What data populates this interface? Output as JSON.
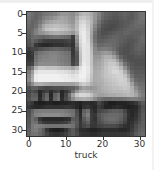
{
  "chart_data": {
    "type": "heatmap",
    "title": "",
    "xlabel": "truck",
    "ylabel": "",
    "colormap": "gray",
    "xlim": [
      -0.5,
      31.5
    ],
    "ylim": [
      31.5,
      -0.5
    ],
    "xticks": [
      0,
      10,
      20,
      30
    ],
    "yticks": [
      0,
      5,
      10,
      15,
      20,
      25,
      30
    ],
    "shape": [
      32,
      32
    ],
    "pixels": [
      [
        120,
        110,
        100,
        105,
        115,
        120,
        125,
        130,
        140,
        150,
        150,
        145,
        140,
        155,
        175,
        185,
        180,
        170,
        150,
        130,
        110,
        100,
        95,
        90,
        90,
        95,
        100,
        95,
        90,
        100,
        110,
        115
      ],
      [
        115,
        105,
        100,
        110,
        125,
        135,
        140,
        150,
        160,
        165,
        160,
        150,
        145,
        170,
        195,
        200,
        190,
        175,
        150,
        125,
        105,
        95,
        90,
        85,
        85,
        90,
        95,
        90,
        90,
        100,
        110,
        115
      ],
      [
        110,
        100,
        105,
        120,
        140,
        155,
        165,
        170,
        175,
        170,
        165,
        155,
        150,
        180,
        210,
        215,
        200,
        180,
        145,
        115,
        95,
        85,
        80,
        80,
        80,
        85,
        90,
        90,
        95,
        105,
        110,
        110
      ],
      [
        105,
        100,
        110,
        135,
        165,
        180,
        185,
        190,
        190,
        185,
        180,
        170,
        160,
        185,
        220,
        225,
        205,
        175,
        135,
        105,
        85,
        80,
        75,
        75,
        80,
        85,
        90,
        95,
        100,
        105,
        105,
        105
      ],
      [
        100,
        105,
        125,
        150,
        175,
        195,
        200,
        205,
        200,
        195,
        190,
        180,
        170,
        190,
        225,
        230,
        210,
        170,
        125,
        95,
        80,
        75,
        75,
        80,
        85,
        90,
        95,
        100,
        100,
        100,
        100,
        100
      ],
      [
        95,
        110,
        130,
        145,
        150,
        160,
        170,
        175,
        175,
        170,
        165,
        160,
        150,
        175,
        225,
        235,
        215,
        165,
        115,
        90,
        80,
        80,
        85,
        90,
        95,
        95,
        100,
        100,
        95,
        95,
        95,
        100
      ],
      [
        90,
        105,
        110,
        105,
        100,
        105,
        110,
        115,
        115,
        110,
        105,
        100,
        60,
        150,
        220,
        235,
        215,
        160,
        110,
        90,
        85,
        90,
        95,
        100,
        100,
        95,
        95,
        90,
        90,
        95,
        100,
        105
      ],
      [
        85,
        100,
        90,
        75,
        65,
        60,
        60,
        60,
        60,
        60,
        65,
        70,
        55,
        140,
        215,
        235,
        220,
        165,
        115,
        95,
        95,
        100,
        105,
        105,
        100,
        95,
        90,
        85,
        85,
        90,
        100,
        105
      ],
      [
        80,
        90,
        55,
        45,
        40,
        40,
        45,
        50,
        50,
        50,
        55,
        60,
        50,
        125,
        210,
        230,
        225,
        175,
        125,
        105,
        105,
        110,
        110,
        105,
        100,
        90,
        85,
        80,
        85,
        95,
        100,
        100
      ],
      [
        60,
        70,
        70,
        80,
        85,
        90,
        95,
        100,
        100,
        95,
        90,
        85,
        55,
        105,
        200,
        230,
        225,
        185,
        135,
        120,
        125,
        125,
        120,
        110,
        95,
        85,
        80,
        80,
        85,
        95,
        100,
        95
      ],
      [
        50,
        60,
        100,
        115,
        120,
        125,
        130,
        130,
        125,
        120,
        115,
        110,
        55,
        90,
        195,
        230,
        225,
        190,
        140,
        140,
        150,
        155,
        150,
        130,
        105,
        85,
        80,
        80,
        85,
        90,
        95,
        90
      ],
      [
        50,
        55,
        110,
        125,
        130,
        130,
        135,
        135,
        130,
        125,
        120,
        115,
        60,
        85,
        190,
        230,
        225,
        195,
        150,
        150,
        165,
        175,
        175,
        160,
        130,
        100,
        85,
        80,
        80,
        85,
        85,
        85
      ],
      [
        55,
        60,
        115,
        130,
        135,
        135,
        135,
        135,
        130,
        125,
        120,
        115,
        65,
        85,
        190,
        230,
        225,
        195,
        155,
        160,
        170,
        185,
        190,
        185,
        160,
        125,
        95,
        85,
        80,
        80,
        80,
        80
      ],
      [
        65,
        70,
        125,
        140,
        140,
        140,
        140,
        140,
        135,
        130,
        125,
        120,
        70,
        90,
        195,
        235,
        225,
        195,
        160,
        165,
        175,
        190,
        200,
        200,
        185,
        155,
        115,
        95,
        85,
        80,
        80,
        80
      ],
      [
        100,
        120,
        180,
        200,
        200,
        195,
        195,
        195,
        190,
        185,
        180,
        175,
        165,
        185,
        225,
        240,
        230,
        200,
        165,
        170,
        180,
        195,
        205,
        210,
        205,
        185,
        145,
        110,
        90,
        85,
        85,
        85
      ],
      [
        120,
        155,
        220,
        230,
        230,
        230,
        230,
        230,
        225,
        225,
        220,
        215,
        205,
        215,
        235,
        240,
        230,
        200,
        170,
        175,
        185,
        195,
        205,
        215,
        215,
        205,
        175,
        135,
        100,
        90,
        90,
        90
      ],
      [
        130,
        170,
        235,
        240,
        240,
        240,
        240,
        240,
        240,
        235,
        235,
        230,
        225,
        230,
        240,
        240,
        225,
        195,
        170,
        175,
        185,
        195,
        200,
        205,
        210,
        210,
        195,
        160,
        115,
        95,
        95,
        95
      ],
      [
        135,
        175,
        235,
        240,
        240,
        240,
        240,
        240,
        240,
        240,
        235,
        235,
        230,
        230,
        235,
        235,
        220,
        190,
        170,
        175,
        180,
        190,
        195,
        200,
        205,
        210,
        205,
        180,
        135,
        105,
        100,
        100
      ],
      [
        110,
        140,
        170,
        175,
        170,
        165,
        160,
        160,
        160,
        160,
        160,
        160,
        160,
        170,
        195,
        205,
        195,
        175,
        165,
        170,
        175,
        185,
        190,
        195,
        200,
        205,
        205,
        195,
        160,
        120,
        110,
        110
      ],
      [
        80,
        95,
        95,
        80,
        75,
        70,
        75,
        80,
        80,
        80,
        85,
        90,
        95,
        110,
        145,
        160,
        155,
        150,
        155,
        165,
        175,
        180,
        185,
        190,
        190,
        195,
        200,
        195,
        175,
        140,
        120,
        115
      ],
      [
        70,
        80,
        70,
        40,
        55,
        65,
        45,
        60,
        70,
        40,
        55,
        75,
        110,
        150,
        175,
        180,
        175,
        165,
        160,
        165,
        170,
        175,
        180,
        185,
        185,
        185,
        190,
        190,
        180,
        155,
        130,
        120
      ],
      [
        75,
        95,
        90,
        40,
        75,
        100,
        40,
        95,
        110,
        40,
        70,
        110,
        160,
        200,
        215,
        215,
        210,
        195,
        170,
        160,
        160,
        165,
        170,
        170,
        175,
        175,
        180,
        185,
        180,
        165,
        140,
        125
      ],
      [
        80,
        100,
        100,
        45,
        80,
        105,
        45,
        100,
        115,
        45,
        75,
        100,
        140,
        165,
        170,
        175,
        170,
        160,
        140,
        120,
        110,
        105,
        105,
        110,
        110,
        110,
        115,
        120,
        125,
        125,
        120,
        115
      ],
      [
        65,
        55,
        35,
        30,
        30,
        35,
        35,
        30,
        30,
        35,
        35,
        40,
        45,
        40,
        35,
        45,
        45,
        40,
        45,
        70,
        55,
        40,
        30,
        30,
        35,
        35,
        35,
        40,
        45,
        55,
        75,
        90
      ],
      [
        55,
        45,
        40,
        40,
        45,
        50,
        50,
        50,
        50,
        50,
        55,
        55,
        50,
        40,
        30,
        50,
        55,
        45,
        40,
        60,
        50,
        35,
        35,
        40,
        45,
        40,
        35,
        30,
        35,
        40,
        60,
        80
      ],
      [
        75,
        100,
        120,
        125,
        125,
        125,
        125,
        125,
        125,
        125,
        120,
        115,
        110,
        75,
        40,
        95,
        110,
        55,
        45,
        70,
        75,
        80,
        90,
        95,
        95,
        90,
        70,
        45,
        40,
        45,
        65,
        85
      ],
      [
        80,
        110,
        130,
        135,
        140,
        140,
        140,
        140,
        140,
        135,
        130,
        125,
        115,
        80,
        45,
        105,
        125,
        60,
        55,
        85,
        95,
        100,
        105,
        105,
        105,
        100,
        80,
        50,
        40,
        50,
        70,
        90
      ],
      [
        85,
        110,
        95,
        55,
        40,
        40,
        40,
        40,
        40,
        40,
        45,
        50,
        90,
        85,
        50,
        90,
        110,
        60,
        50,
        80,
        95,
        105,
        110,
        110,
        105,
        95,
        75,
        45,
        45,
        55,
        75,
        90
      ],
      [
        85,
        115,
        110,
        75,
        60,
        55,
        55,
        55,
        55,
        60,
        65,
        80,
        105,
        90,
        55,
        80,
        95,
        60,
        55,
        75,
        85,
        95,
        100,
        100,
        95,
        85,
        65,
        45,
        50,
        65,
        80,
        95
      ],
      [
        90,
        120,
        130,
        125,
        120,
        115,
        115,
        115,
        115,
        115,
        120,
        120,
        115,
        85,
        55,
        70,
        80,
        55,
        55,
        65,
        70,
        75,
        75,
        75,
        70,
        60,
        50,
        45,
        55,
        75,
        90,
        95
      ],
      [
        95,
        120,
        125,
        110,
        90,
        55,
        35,
        30,
        30,
        35,
        50,
        75,
        90,
        70,
        45,
        45,
        40,
        35,
        35,
        40,
        45,
        45,
        45,
        45,
        45,
        40,
        40,
        45,
        60,
        80,
        95,
        100
      ],
      [
        100,
        115,
        115,
        105,
        90,
        70,
        55,
        50,
        50,
        55,
        65,
        80,
        90,
        75,
        55,
        50,
        50,
        45,
        45,
        50,
        55,
        55,
        55,
        55,
        55,
        55,
        55,
        60,
        70,
        90,
        100,
        105
      ]
    ]
  },
  "axes": {
    "yticks": [
      {
        "label": "0",
        "top": 14
      },
      {
        "label": "5",
        "top": 33.4
      },
      {
        "label": "10",
        "top": 52.8
      },
      {
        "label": "15",
        "top": 72.1
      },
      {
        "label": "20",
        "top": 91.5
      },
      {
        "label": "25",
        "top": 110.8
      },
      {
        "label": "30",
        "top": 130.2
      }
    ],
    "xticks": [
      {
        "label": "0",
        "left": 28.8
      },
      {
        "label": "10",
        "left": 65.7
      },
      {
        "label": "20",
        "left": 102.6
      },
      {
        "label": "30",
        "left": 139.5
      }
    ],
    "xlabel": "truck"
  }
}
